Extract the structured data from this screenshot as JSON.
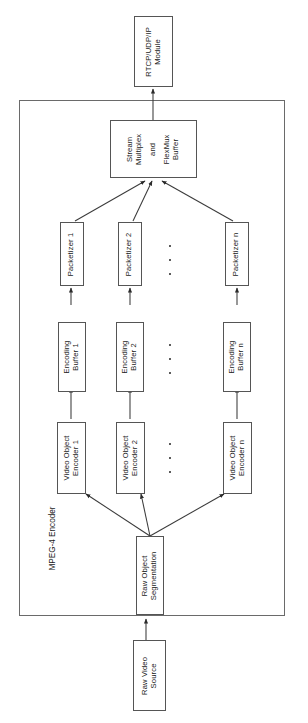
{
  "figure": {
    "type": "block-diagram",
    "orientation": "rotated-90-ccw",
    "caption": "Figure 1. MPEG-4",
    "container": {
      "label": "MPEG-4 Encoder"
    },
    "nodes": {
      "raw_video_source": "Raw Video\nSource",
      "raw_video_source_line1": "Raw Video",
      "raw_video_source_line2": "Source",
      "raw_object_segmentation_line1": "Raw Object",
      "raw_object_segmentation_line2": "Segmentation",
      "stream_multiplex_line1": "Stream",
      "stream_multiplex_line2": "Multiplex",
      "stream_multiplex_line3": "and",
      "stream_multiplex_line4": "FlexMux",
      "stream_multiplex_line5": "Buffer",
      "rtcp_module_line1": "RTCP/UDP/IP",
      "rtcp_module_line2": "Module"
    },
    "chains": [
      {
        "id": "chain-1",
        "video_object_encoder_line1": "Video Object",
        "video_object_encoder_line2": "Encoder 1",
        "encoding_buffer_line1": "Encoding",
        "encoding_buffer_line2": "Buffer 1",
        "packetizer": "Packetizer 1"
      },
      {
        "id": "chain-2",
        "video_object_encoder_line1": "Video Object",
        "video_object_encoder_line2": "Encoder 2",
        "encoding_buffer_line1": "Encoding",
        "encoding_buffer_line2": "Buffer 2",
        "packetizer": "Packetizer 2"
      },
      {
        "id": "chain-n",
        "video_object_encoder_line1": "Video Object",
        "video_object_encoder_line2": "Encoder n",
        "encoding_buffer_line1": "Encoding",
        "encoding_buffer_line2": "Buffer n",
        "packetizer": "Packetizer n"
      }
    ],
    "ellipsis": {
      "count": 3,
      "rows": [
        "packetizer-row",
        "encoding-buffer-row",
        "video-object-encoder-row"
      ]
    },
    "colors": {
      "box_border": "#555555",
      "container_border": "#6a6a6a",
      "box_fill": "#ffffff",
      "text": "#1a1a1a",
      "connector": "#3a3a3a",
      "page_background": "#ffffff"
    }
  }
}
